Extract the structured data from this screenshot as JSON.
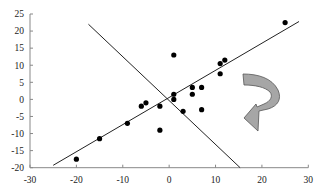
{
  "chart_data": {
    "type": "scatter",
    "title": "",
    "xlabel": "",
    "ylabel": "",
    "xlim": [
      -30,
      30
    ],
    "ylim": [
      -20,
      25
    ],
    "x_ticks": [
      -30,
      -20,
      -10,
      0,
      10,
      20,
      30
    ],
    "y_ticks": [
      -20,
      -15,
      -10,
      -5,
      0,
      5,
      10,
      15,
      20,
      25
    ],
    "grid": false,
    "legend": null,
    "series": [
      {
        "name": "points",
        "points": [
          [
            -20,
            -17.5
          ],
          [
            -15,
            -11.5
          ],
          [
            -9,
            -7
          ],
          [
            -6,
            -2
          ],
          [
            -5,
            -1
          ],
          [
            -2,
            -2
          ],
          [
            -2,
            -9
          ],
          [
            1,
            1.5
          ],
          [
            1,
            0
          ],
          [
            1,
            13
          ],
          [
            3,
            -3.5
          ],
          [
            5,
            3.5
          ],
          [
            5,
            1.5
          ],
          [
            7,
            3.5
          ],
          [
            7,
            -3
          ],
          [
            11,
            10.5
          ],
          [
            12,
            11.5
          ],
          [
            11,
            7.5
          ],
          [
            25,
            22.5
          ]
        ],
        "color": "#000000"
      }
    ],
    "lines": [
      {
        "name": "fit-line",
        "from": [
          -25,
          -19.3
        ],
        "to": [
          28,
          22.8
        ],
        "color": "#222222"
      },
      {
        "name": "perpendicular-line",
        "from": [
          -17.4,
          22
        ],
        "to": [
          15.3,
          -20
        ],
        "color": "#222222"
      }
    ],
    "annotations": [
      {
        "type": "curved-arrow",
        "description": "rotation arrow pointing left",
        "fill": "#a6a6a6",
        "stroke": "#555555"
      }
    ]
  },
  "colors": {
    "axis": "#888888",
    "text": "#222222",
    "points": "#000000",
    "arrow_fill": "#a6a6a6",
    "arrow_stroke": "#555555"
  }
}
